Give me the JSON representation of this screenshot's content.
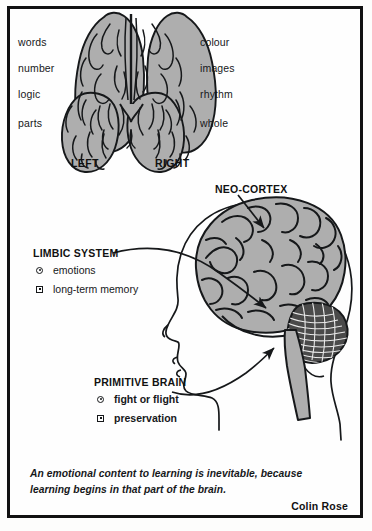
{
  "figure": {
    "title_hidden": "Triune brain and hemispheres diagram",
    "accent_fill": "#aeaeae",
    "ink": "#16181a",
    "cerebellum_fill": "#4a4a4a"
  },
  "hemispheres": {
    "left_caption": "LEFT",
    "right_caption": "RIGHT",
    "left_traits": [
      "words",
      "number",
      "logic",
      "parts"
    ],
    "right_traits": [
      "colour",
      "images",
      "rhythm",
      "whole"
    ],
    "brain_icon": "brain-top-view-icon"
  },
  "callouts": {
    "neocortex": {
      "title": "NEO-CORTEX",
      "arrow_icon": "arrow-pointer-icon"
    },
    "limbic": {
      "title": "LIMBIC SYSTEM",
      "items": [
        {
          "marker": "circle-dot-icon",
          "text": "emotions"
        },
        {
          "marker": "square-dot-icon",
          "text": "long-term memory"
        }
      ],
      "arrow_icon": "curved-arrow-icon"
    },
    "primitive": {
      "title": "PRIMITIVE BRAIN",
      "items": [
        {
          "marker": "circle-dot-icon",
          "text": "fight or flight"
        },
        {
          "marker": "square-dot-icon",
          "text": "preservation"
        }
      ],
      "arrow_icon": "curved-arrow-icon"
    }
  },
  "head_figure": {
    "profile_icon": "head-profile-icon",
    "cortex_icon": "cerebrum-icon",
    "cerebellum_icon": "cerebellum-icon",
    "brainstem_icon": "brainstem-icon"
  },
  "quote": {
    "text": "An emotional content to learning is inevitable, because learning begins in that part of the brain.",
    "attribution": "Colin Rose"
  }
}
